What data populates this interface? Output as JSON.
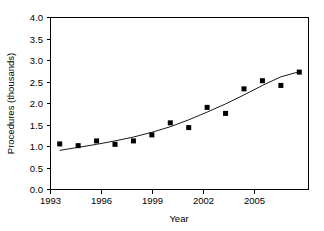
{
  "chart_data": {
    "type": "scatter",
    "title": "",
    "xlabel": "Year",
    "ylabel": "Procedures (thousands)",
    "xlim": [
      1992.5,
      2006.5
    ],
    "ylim": [
      0.0,
      4.0
    ],
    "grid": false,
    "legend": null,
    "x_ticks": [
      1993,
      1996,
      1999,
      2002,
      2005
    ],
    "x_tick_labels": [
      "1993",
      "1996",
      "1999",
      "2002",
      "2005"
    ],
    "y_ticks": [
      0.0,
      0.5,
      1.0,
      1.5,
      2.0,
      2.5,
      3.0,
      3.5,
      4.0
    ],
    "y_tick_labels": [
      "0.0",
      "0.5",
      "1.0",
      "1.5",
      "2.0",
      "2.5",
      "3.0",
      "3.5",
      "4.0"
    ],
    "marker": "filled-square",
    "marker_color": "#000000",
    "line_color": "#000000",
    "x": [
      1993,
      1994,
      1995,
      1996,
      1997,
      1998,
      1999,
      2000,
      2001,
      2002,
      2003,
      2004,
      2005,
      2006
    ],
    "values": [
      1.06,
      1.02,
      1.13,
      1.05,
      1.13,
      1.27,
      1.55,
      1.44,
      1.91,
      1.77,
      2.34,
      2.53,
      2.42,
      2.73
    ],
    "series": [
      {
        "name": "Procedures",
        "values": [
          1.06,
          1.02,
          1.13,
          1.05,
          1.13,
          1.27,
          1.55,
          1.44,
          1.91,
          1.77,
          2.34,
          2.53,
          2.42,
          2.73
        ]
      },
      {
        "name": "Fitted trend",
        "type": "line",
        "x": [
          1993,
          1994,
          1995,
          1996,
          1997,
          1998,
          1999,
          2000,
          2001,
          2002,
          2003,
          2004,
          2005,
          2006
        ],
        "values": [
          0.91,
          0.98,
          1.05,
          1.13,
          1.22,
          1.33,
          1.46,
          1.62,
          1.8,
          1.99,
          2.2,
          2.42,
          2.62,
          2.74
        ]
      }
    ]
  },
  "axes": {
    "x_title": "Year",
    "y_title": "Procedures (thousands)"
  }
}
